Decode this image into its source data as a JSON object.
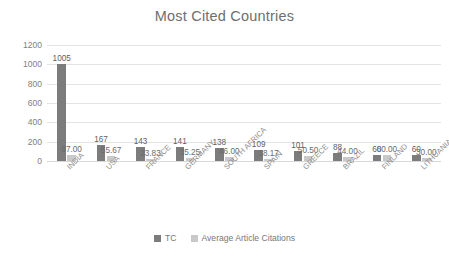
{
  "chart_data": {
    "type": "bar",
    "title": "Most Cited Countries",
    "xlabel": "",
    "ylabel": "",
    "ylim": [
      0,
      1200
    ],
    "yticks": [
      0,
      200,
      400,
      600,
      800,
      1000,
      1200
    ],
    "ytick_labels": [
      "0",
      "200",
      "400",
      "600",
      "800",
      "1000",
      "1200"
    ],
    "grid": true,
    "legend_position": "bottom",
    "categories": [
      "INDIA",
      "USA",
      "FRANCE",
      "GERMANY",
      "SOUTH AFRICA",
      "SPAIN",
      "GREECE",
      "BRAZIL",
      "FINLAND",
      "LITHUANIA"
    ],
    "series": [
      {
        "name": "TC",
        "color": "#7c7c7c",
        "values": [
          1005,
          167,
          143,
          141,
          138,
          109,
          101,
          88,
          60,
          60
        ],
        "labels": [
          "1005",
          "167",
          "143",
          "141",
          "138",
          "109",
          "101",
          "88",
          "60",
          "60"
        ]
      },
      {
        "name": "Average Article Citations",
        "color": "#c9c9c9",
        "values": [
          67.0,
          55.67,
          23.83,
          35.25,
          46.0,
          18.17,
          50.5,
          44.0,
          60.0,
          30.0
        ],
        "labels": [
          "67.00",
          "55.67",
          "23.83",
          "35.25",
          "46.00",
          "18.17",
          "50.50",
          "44.00",
          "60.00",
          "30.00"
        ]
      }
    ]
  },
  "legend": {
    "items": [
      {
        "label": "TC",
        "color": "#7c7c7c"
      },
      {
        "label": "Average Article Citations",
        "color": "#c9c9c9"
      }
    ]
  },
  "colors": {
    "tc": "#7c7c7c",
    "avg": "#c9c9c9",
    "grid": "#e4e4e4",
    "text": "#808080",
    "title": "#6e6e6e",
    "background": "#ffffff"
  }
}
